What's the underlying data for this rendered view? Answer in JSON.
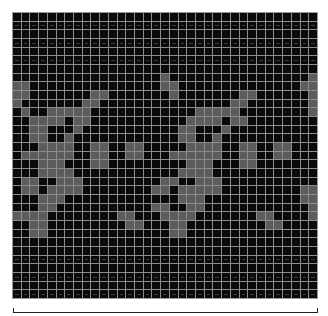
{
  "grid": {
    "columns": 35,
    "rows": 33,
    "colors": {
      "off": "#0a0a0a",
      "on": "#5c5c5c",
      "gridline": "#8c8c8c"
    },
    "dashed_rows": [
      1,
      3,
      5,
      28,
      30,
      32
    ],
    "pattern": [
      "00000000000000000000000000000000000",
      "00000000000000000000000000000000000",
      "00000000000000000000000000000000000",
      "00000000000000000000000000000000000",
      "00000000000000000000000000000000000",
      "00000000000000000000000000000000000",
      "00000000000000000000000000000000000",
      "00000000000000000100000000000000001",
      "11000000000000000110000000000000011",
      "11000000011000000010000000110000001",
      "10000000110000000000000001100000001",
      "01001111100000000000011111000000001",
      "00111101100000000000111101100000000",
      "00110001000000000001100010000000000",
      "00110010000000000001100100000000000",
      "00011110011001100000111100110011000",
      "01111110011001100011111100110011000",
      "00011100011000000000111000110000000",
      "00011110000000000001111000000000000",
      "01100111000000000110011100000000000",
      "01101111000000001101111100000000011",
      "00011100000000000001110000000000011",
      "00011000000000001100110000000000001",
      "11110000000011000111100000001100001",
      "00110000000001100011000000000110000",
      "00110000000000000011000000000000000",
      "00000000000000000000000000000000000",
      "00000000000000000000000000000000000",
      "00000000000000000000000000000000000",
      "00000000000000000000000000000000000",
      "00000000000000000000000000000000000",
      "00000000000000000000000000000000000",
      "00000000000000000000000000000000000"
    ]
  },
  "bracket": {
    "label": ""
  }
}
